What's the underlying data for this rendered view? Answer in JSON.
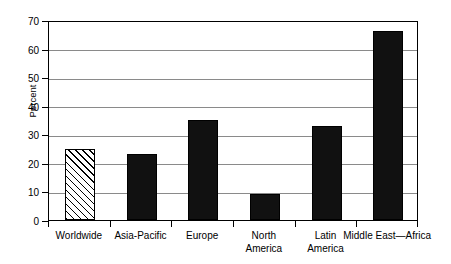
{
  "chart_data": {
    "type": "bar",
    "title": "",
    "subtitle": "",
    "xlabel": "",
    "ylabel": "Percent",
    "ylim": [
      0,
      70
    ],
    "yticks": [
      0,
      10,
      20,
      30,
      40,
      50,
      60,
      70
    ],
    "ytick_labels": [
      "0",
      "10",
      "20",
      "30",
      "40",
      "50",
      "60",
      "70"
    ],
    "grid": "horizontal",
    "legend": "none",
    "units": "percent",
    "categories": [
      "Worldwide",
      "Asia-Pacific",
      "Europe",
      "North America",
      "Latin America",
      "Middle East—Africa"
    ],
    "values": [
      25,
      23,
      35,
      9,
      33,
      66
    ],
    "bar_styles": [
      "hatched",
      "solid",
      "solid",
      "solid",
      "solid",
      "solid"
    ],
    "colors": {
      "bar_solid": "#111111",
      "bar_hatch_fill": "#ffffff",
      "bar_outline": "#000000",
      "gridline": "#8a8a8a",
      "axis": "#000000",
      "background": "#ffffff",
      "text": "#000000"
    },
    "points": [
      {
        "category": "Worldwide",
        "value": 25,
        "style": "hatched"
      },
      {
        "category": "Asia-Pacific",
        "value": 23,
        "style": "solid"
      },
      {
        "category": "Europe",
        "value": 35,
        "style": "solid"
      },
      {
        "category": "North America",
        "value": 9,
        "style": "solid"
      },
      {
        "category": "Latin America",
        "value": 33,
        "style": "solid"
      },
      {
        "category": "Middle East—Africa",
        "value": 66,
        "style": "solid"
      }
    ]
  },
  "axis": {
    "y_title": "Percent",
    "ticks": [
      {
        "label": "70",
        "value": 70
      },
      {
        "label": "60",
        "value": 60
      },
      {
        "label": "50",
        "value": 50
      },
      {
        "label": "40",
        "value": 40
      },
      {
        "label": "30",
        "value": 30
      },
      {
        "label": "20",
        "value": 20
      },
      {
        "label": "10",
        "value": 10
      },
      {
        "label": "0",
        "value": 0
      }
    ]
  },
  "x_axis_labels": [
    {
      "lines": [
        "Worldwide"
      ]
    },
    {
      "lines": [
        "Asia-Pacific"
      ]
    },
    {
      "lines": [
        "Europe"
      ]
    },
    {
      "lines": [
        "North",
        "America"
      ]
    },
    {
      "lines": [
        "Latin",
        "America"
      ]
    },
    {
      "lines": [
        "Middle East—Africa"
      ]
    }
  ]
}
